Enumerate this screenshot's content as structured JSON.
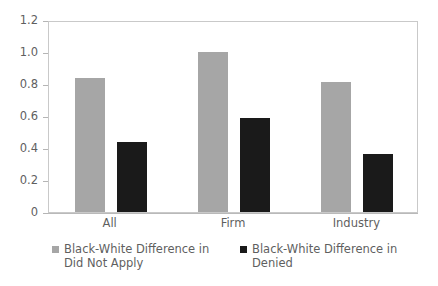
{
  "chart_data": {
    "type": "bar",
    "title": "",
    "subtitle": "",
    "xlabel": "",
    "ylabel": "",
    "categories": [
      "All",
      "Firm",
      "Industry"
    ],
    "series": [
      {
        "name": "Black-White Difference in Did Not Apply",
        "color": "#a6a6a6",
        "values": [
          0.84,
          1.0,
          0.81
        ]
      },
      {
        "name": "Black-White Difference in Denied",
        "color": "#1a1a1a",
        "values": [
          0.44,
          0.59,
          0.36
        ]
      }
    ],
    "ylim": [
      0,
      1.2
    ],
    "ytick_values": [
      0,
      0.2,
      0.4,
      0.6,
      0.8,
      1.0,
      1.2
    ],
    "ytick_labels": [
      "0",
      "0.2",
      "0.4",
      "0.6",
      "0.8",
      "1.0",
      "1.2"
    ],
    "grid": false,
    "legend_position": "bottom",
    "annotations": []
  },
  "legend": {
    "items": [
      {
        "label": "Black-White Difference in Did Not Apply",
        "color": "#a6a6a6"
      },
      {
        "label": "Black-White Difference in Denied",
        "color": "#1a1a1a"
      }
    ]
  },
  "colors": {
    "series_gray": "#a6a6a6",
    "series_black": "#1a1a1a",
    "axis": "#b9b9b9",
    "frame": "#c9c9c9",
    "text": "#5f5f5f",
    "background": "#ffffff"
  }
}
